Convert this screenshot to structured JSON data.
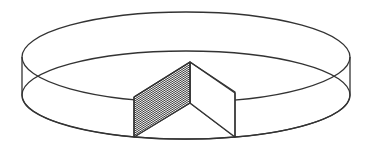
{
  "diagram": {
    "colors": {
      "background": "#ffffff",
      "line": "#333333",
      "hatch": "#333333"
    },
    "cylinder": {
      "center_x": 186,
      "top_center_y": 57,
      "bottom_center_y": 95,
      "rx": 164,
      "ry": 45
    },
    "wedge": {
      "apex_top": [
        190,
        62
      ],
      "apex_bottom": [
        190,
        103
      ],
      "left_edge_x": 134,
      "right_edge_x": 235,
      "hatched_face": "left"
    }
  }
}
